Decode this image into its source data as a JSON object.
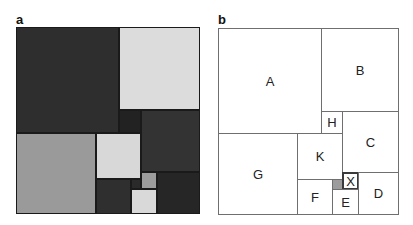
{
  "panels": [
    {
      "label": "a",
      "label_pos": [
        16,
        13
      ],
      "bounds": [
        16,
        27,
        184,
        187
      ],
      "tiles": [
        {
          "id": "A",
          "x": 16,
          "y": 27,
          "w": 103,
          "h": 106,
          "color": "#2e2e2e"
        },
        {
          "id": "B",
          "x": 119,
          "y": 27,
          "w": 81,
          "h": 83,
          "color": "#dcdcdc"
        },
        {
          "id": "H",
          "x": 119,
          "y": 110,
          "w": 22,
          "h": 23,
          "color": "#222222"
        },
        {
          "id": "C",
          "x": 141,
          "y": 110,
          "w": 59,
          "h": 62,
          "color": "#333333"
        },
        {
          "id": "G",
          "x": 16,
          "y": 133,
          "w": 80,
          "h": 81,
          "color": "#9a9a9a"
        },
        {
          "id": "K",
          "x": 96,
          "y": 133,
          "w": 45,
          "h": 46,
          "color": "#d8d8d8"
        },
        {
          "id": "F",
          "x": 96,
          "y": 179,
          "w": 35,
          "h": 35,
          "color": "#2f2f2f"
        },
        {
          "id": "S",
          "x": 131,
          "y": 179,
          "w": 10,
          "h": 10,
          "color": "#2a2a2a"
        },
        {
          "id": "X",
          "x": 141,
          "y": 172,
          "w": 16,
          "h": 17,
          "color": "#9c9c9c"
        },
        {
          "id": "E",
          "x": 131,
          "y": 189,
          "w": 26,
          "h": 25,
          "color": "#d9d9d9"
        },
        {
          "id": "D",
          "x": 157,
          "y": 172,
          "w": 43,
          "h": 42,
          "color": "#262626"
        }
      ]
    },
    {
      "label": "b",
      "label_pos": [
        218,
        13
      ],
      "bounds": [
        218,
        28,
        181,
        187
      ],
      "tiles": [
        {
          "id": "A",
          "text": "A",
          "x": 218,
          "y": 28,
          "w": 104,
          "h": 106
        },
        {
          "id": "B",
          "text": "B",
          "x": 321,
          "y": 28,
          "w": 78,
          "h": 84
        },
        {
          "id": "H",
          "text": "H",
          "x": 321,
          "y": 111,
          "w": 22,
          "h": 23
        },
        {
          "id": "C",
          "text": "C",
          "x": 342,
          "y": 111,
          "w": 57,
          "h": 62
        },
        {
          "id": "G",
          "text": "G",
          "x": 218,
          "y": 133,
          "w": 80,
          "h": 82
        },
        {
          "id": "K",
          "text": "K",
          "x": 297,
          "y": 133,
          "w": 46,
          "h": 47
        },
        {
          "id": "F",
          "text": "F",
          "x": 297,
          "y": 179,
          "w": 36,
          "h": 36
        },
        {
          "id": "S",
          "text": "",
          "x": 332,
          "y": 179,
          "w": 11,
          "h": 11,
          "gray": true
        },
        {
          "id": "X",
          "text": "X",
          "x": 342,
          "y": 172,
          "w": 17,
          "h": 18,
          "thick": true
        },
        {
          "id": "E",
          "text": "E",
          "x": 332,
          "y": 189,
          "w": 27,
          "h": 26
        },
        {
          "id": "D",
          "text": "D",
          "x": 358,
          "y": 172,
          "w": 41,
          "h": 43
        }
      ]
    }
  ]
}
